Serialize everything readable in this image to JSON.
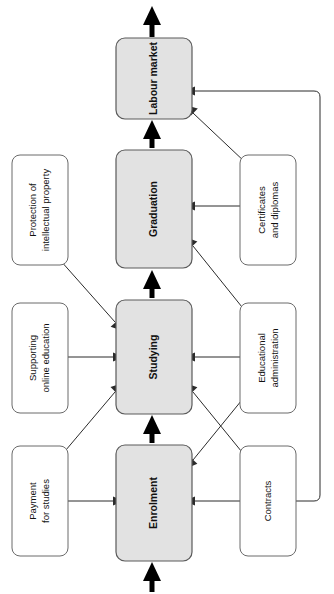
{
  "diagram": {
    "orientation": "vertical-bottom-to-top, labels rotated 90 degrees",
    "colors": {
      "process_fill": "#e2e2e2",
      "process_stroke": "#5a5a5a",
      "support_fill": "#ffffff",
      "support_stroke": "#6a6a6a",
      "line": "#2b2b2b",
      "thick_line": "#000000",
      "background": "#ffffff"
    },
    "process_nodes": [
      {
        "id": "enrolment",
        "label": "Enrolment"
      },
      {
        "id": "studying",
        "label": "Studying"
      },
      {
        "id": "graduation",
        "label": "Graduation"
      },
      {
        "id": "labour_market",
        "label": "Labour market"
      }
    ],
    "left_nodes": [
      {
        "id": "payment_for_studies",
        "label_line1": "Payment",
        "label_line2": "for studies"
      },
      {
        "id": "supporting_online_education",
        "label_line1": "Supporting",
        "label_line2": "online education"
      },
      {
        "id": "protection_of_intellectual_property",
        "label_line1": "Protection of",
        "label_line2": "intellectual property"
      }
    ],
    "right_nodes": [
      {
        "id": "contracts",
        "label_line1": "Contracts",
        "label_line2": ""
      },
      {
        "id": "educational_administration",
        "label_line1": "Educational",
        "label_line2": "administration"
      },
      {
        "id": "certificates_and_diplomas",
        "label_line1": "Certificates",
        "label_line2": "and diplomas"
      }
    ],
    "connections": [
      {
        "from": "external-bottom",
        "to": "enrolment",
        "style": "thick"
      },
      {
        "from": "enrolment",
        "to": "studying",
        "style": "thick"
      },
      {
        "from": "studying",
        "to": "graduation",
        "style": "thick"
      },
      {
        "from": "graduation",
        "to": "labour_market",
        "style": "thick"
      },
      {
        "from": "labour_market",
        "to": "external-top",
        "style": "thick"
      },
      {
        "from": "payment_for_studies",
        "to": "enrolment",
        "style": "thin"
      },
      {
        "from": "payment_for_studies",
        "to": "studying",
        "style": "thin"
      },
      {
        "from": "supporting_online_education",
        "to": "studying",
        "style": "thin"
      },
      {
        "from": "protection_of_intellectual_property",
        "to": "studying",
        "style": "thin"
      },
      {
        "from": "contracts",
        "to": "enrolment",
        "style": "thin"
      },
      {
        "from": "contracts",
        "to": "studying",
        "style": "thin"
      },
      {
        "from": "contracts",
        "to": "labour_market",
        "style": "thin-routed-right"
      },
      {
        "from": "educational_administration",
        "to": "studying",
        "style": "thin"
      },
      {
        "from": "educational_administration",
        "to": "enrolment",
        "style": "thin"
      },
      {
        "from": "educational_administration",
        "to": "graduation",
        "style": "thin"
      },
      {
        "from": "certificates_and_diplomas",
        "to": "graduation",
        "style": "thin"
      },
      {
        "from": "certificates_and_diplomas",
        "to": "labour_market",
        "style": "thin"
      }
    ]
  }
}
